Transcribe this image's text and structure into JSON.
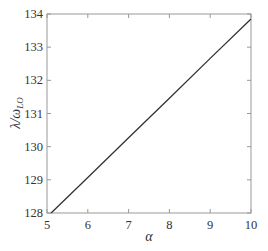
{
  "chart_data": {
    "type": "line",
    "title": "",
    "xlabel": "α",
    "ylabel": "λ/ω_LO",
    "ylabel_main": "λ/ω",
    "ylabel_sub": "LO",
    "xlim": [
      5,
      10
    ],
    "ylim": [
      128,
      134
    ],
    "xticks": [
      5,
      6,
      7,
      8,
      9,
      10
    ],
    "yticks": [
      128,
      129,
      130,
      131,
      132,
      133,
      134
    ],
    "grid": false,
    "legend": null,
    "series": [
      {
        "name": "λ/ω_LO",
        "color": "#333333",
        "x": [
          5.1,
          6,
          7,
          8,
          9,
          10
        ],
        "y": [
          128.0,
          129.07,
          130.27,
          131.46,
          132.66,
          133.85
        ]
      }
    ]
  },
  "colors": {
    "axis": "#999999",
    "line": "#333333",
    "text": "#333333",
    "background": "#ffffff"
  }
}
